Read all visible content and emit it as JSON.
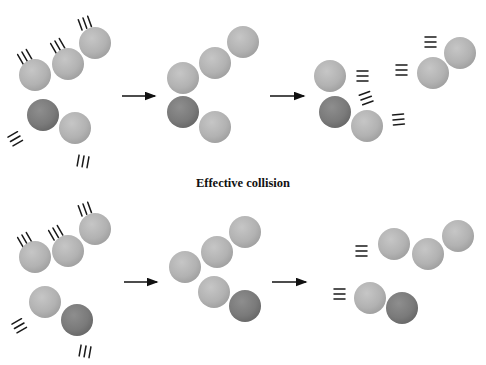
{
  "caption": "Effective collision",
  "colors": {
    "light_atom": "#b4b4b4",
    "dark_atom": "#7e7e7e",
    "motion_lines": "#1a1a1a",
    "arrow": "#111111",
    "background": "#ffffff"
  },
  "rows": [
    {
      "name": "top-row",
      "panels": [
        {
          "name": "reactants",
          "atoms": [
            {
              "x": 35,
              "y": 75,
              "type": "light"
            },
            {
              "x": 68,
              "y": 64,
              "type": "light"
            },
            {
              "x": 95,
              "y": 43,
              "type": "light"
            },
            {
              "x": 43,
              "y": 115,
              "type": "dark"
            },
            {
              "x": 75,
              "y": 128,
              "type": "light"
            }
          ],
          "motion": [
            {
              "x": 22,
              "y": 52,
              "angle": 60
            },
            {
              "x": 55,
              "y": 41,
              "angle": 60
            },
            {
              "x": 83,
              "y": 18,
              "angle": 70
            },
            {
              "x": 20,
              "y": 136,
              "angle": 150
            },
            {
              "x": 84,
              "y": 156,
              "angle": 100
            }
          ]
        },
        {
          "name": "collision",
          "atoms": [
            {
              "x": 183,
              "y": 78,
              "type": "light"
            },
            {
              "x": 215,
              "y": 63,
              "type": "light"
            },
            {
              "x": 243,
              "y": 42,
              "type": "light"
            },
            {
              "x": 183,
              "y": 112,
              "type": "dark"
            },
            {
              "x": 215,
              "y": 127,
              "type": "light"
            }
          ],
          "motion": []
        },
        {
          "name": "products",
          "atoms": [
            {
              "x": 330,
              "y": 76,
              "type": "light"
            },
            {
              "x": 335,
              "y": 112,
              "type": "dark"
            },
            {
              "x": 367,
              "y": 126,
              "type": "light"
            },
            {
              "x": 433,
              "y": 73,
              "type": "light"
            },
            {
              "x": 460,
              "y": 53,
              "type": "light"
            }
          ],
          "motion": [
            {
              "x": 357,
              "y": 76,
              "angle": 0
            },
            {
              "x": 361,
              "y": 100,
              "angle": -20
            },
            {
              "x": 393,
              "y": 120,
              "angle": -5
            },
            {
              "x": 407,
              "y": 70,
              "angle": 180
            },
            {
              "x": 436,
              "y": 42,
              "angle": 180
            }
          ]
        }
      ],
      "arrows": [
        {
          "x1": 122,
          "y1": 96,
          "x2": 155,
          "y2": 96
        },
        {
          "x1": 270,
          "y1": 96,
          "x2": 304,
          "y2": 96
        }
      ]
    },
    {
      "name": "bottom-row",
      "panels": [
        {
          "name": "reactants",
          "atoms": [
            {
              "x": 35,
              "y": 257,
              "type": "light"
            },
            {
              "x": 68,
              "y": 251,
              "type": "light"
            },
            {
              "x": 95,
              "y": 229,
              "type": "light"
            },
            {
              "x": 45,
              "y": 302,
              "type": "light"
            },
            {
              "x": 77,
              "y": 320,
              "type": "dark"
            }
          ],
          "motion": [
            {
              "x": 22,
              "y": 235,
              "angle": 60
            },
            {
              "x": 53,
              "y": 228,
              "angle": 60
            },
            {
              "x": 83,
              "y": 204,
              "angle": 70
            },
            {
              "x": 24,
              "y": 323,
              "angle": 150
            },
            {
              "x": 86,
              "y": 346,
              "angle": 100
            }
          ]
        },
        {
          "name": "collision",
          "atoms": [
            {
              "x": 185,
              "y": 267,
              "type": "light"
            },
            {
              "x": 217,
              "y": 252,
              "type": "light"
            },
            {
              "x": 245,
              "y": 232,
              "type": "light"
            },
            {
              "x": 214,
              "y": 292,
              "type": "light"
            },
            {
              "x": 245,
              "y": 306,
              "type": "dark"
            }
          ],
          "motion": []
        },
        {
          "name": "products",
          "atoms": [
            {
              "x": 394,
              "y": 244,
              "type": "light"
            },
            {
              "x": 428,
              "y": 254,
              "type": "light"
            },
            {
              "x": 458,
              "y": 236,
              "type": "light"
            },
            {
              "x": 370,
              "y": 298,
              "type": "light"
            },
            {
              "x": 402,
              "y": 308,
              "type": "dark"
            }
          ],
          "motion": [
            {
              "x": 367,
              "y": 251,
              "angle": 180
            },
            {
              "x": 345,
              "y": 294,
              "angle": 180
            }
          ]
        }
      ],
      "arrows": [
        {
          "x1": 124,
          "y1": 282,
          "x2": 157,
          "y2": 282
        },
        {
          "x1": 272,
          "y1": 282,
          "x2": 306,
          "y2": 282
        }
      ]
    }
  ]
}
